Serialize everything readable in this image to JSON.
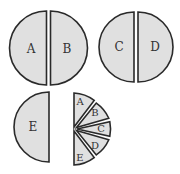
{
  "diagram": {
    "circle1": {
      "left_label": "A",
      "right_label": "B"
    },
    "circle2": {
      "left_label": "C",
      "right_label": "D"
    },
    "half_disc": {
      "label": "E"
    },
    "wedges": [
      "A",
      "B",
      "C",
      "D",
      "E"
    ],
    "colors": {
      "fill": "#e0e0e0",
      "stroke": "#2a2a2a",
      "text": "#333333"
    }
  }
}
